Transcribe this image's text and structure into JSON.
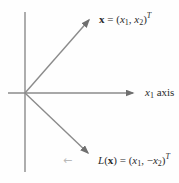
{
  "colors": {
    "background": "#fefefe",
    "line": "#8b8b8b",
    "arrowhead": "#6f6f6f",
    "text": "#2b2b2b",
    "faint_mark": "#b9b9b9"
  },
  "labels": {
    "vector_x": {
      "vec": "x",
      "equals": " = (",
      "var1": "x",
      "var1_sub": "1",
      "separator": ", ",
      "var2": "x",
      "var2_sub": "2",
      "close": ")",
      "transpose": "T"
    },
    "x1_axis": {
      "var": "x",
      "var_sub": "1",
      "text": " axis"
    },
    "vector_lx": {
      "func": "L",
      "open": "(",
      "vec": "x",
      "close_equals": ") = (",
      "var1": "x",
      "var1_sub": "1",
      "separator": ", ",
      "minus": "−",
      "var2": "x",
      "var2_sub": "2",
      "close": ")",
      "transpose": "T"
    },
    "faint_mark": "←"
  }
}
